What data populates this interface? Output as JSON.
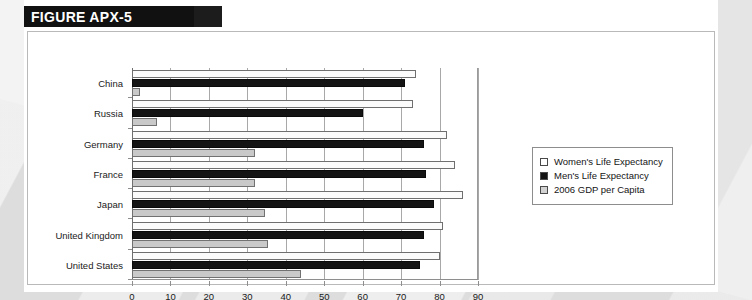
{
  "figure": {
    "title": "FIGURE APX-5"
  },
  "chart_data": {
    "type": "bar",
    "orientation": "horizontal",
    "title": "FIGURE APX-5",
    "xlabel": "",
    "ylabel": "",
    "xlim": [
      0,
      90
    ],
    "xticks": [
      0,
      10,
      20,
      30,
      40,
      50,
      60,
      70,
      80,
      90
    ],
    "grid": true,
    "legend_position": "right",
    "categories": [
      "China",
      "Russia",
      "Germany",
      "France",
      "Japan",
      "United Kingdom",
      "United States"
    ],
    "series": [
      {
        "name": "Women's Life Expectancy",
        "style": "white",
        "color": "#fbfbfb",
        "values": [
          74,
          73,
          82,
          84,
          86,
          81,
          80
        ]
      },
      {
        "name": "Men's Life Expectancy",
        "style": "black",
        "color": "#141414",
        "values": [
          71,
          60,
          76,
          76.5,
          78.5,
          76,
          75
        ]
      },
      {
        "name": "2006 GDP per Capita",
        "style": "gray",
        "color": "#c9c9c9",
        "values": [
          2,
          6.5,
          32,
          32,
          34.5,
          35.5,
          44
        ]
      }
    ]
  },
  "legend": {
    "items": [
      {
        "label": "Women's Life Expectancy",
        "swatch": "white"
      },
      {
        "label": "Men's Life Expectancy",
        "swatch": "black"
      },
      {
        "label": "2006 GDP per Capita",
        "swatch": "gray"
      }
    ]
  },
  "axis_labels": {
    "x": [
      "0",
      "10",
      "20",
      "30",
      "40",
      "50",
      "60",
      "70",
      "80",
      "90"
    ]
  }
}
